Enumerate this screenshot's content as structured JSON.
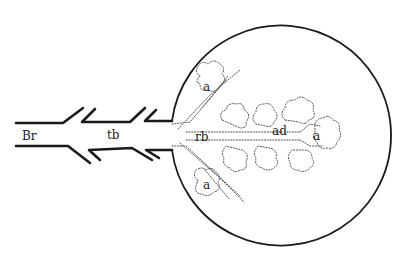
{
  "diagram": {
    "labels": {
      "bronchus": "Br",
      "terminal_bronchiole": "tb",
      "respiratory_bronchiole": "rb",
      "alveolar_duct": "ad",
      "alveolus_upper": "a",
      "alveolus_lower": "a",
      "alveolus_right": "a"
    },
    "colors": {
      "line": "#1a1a1a",
      "dotted": "#555555",
      "background": "#ffffff"
    }
  }
}
